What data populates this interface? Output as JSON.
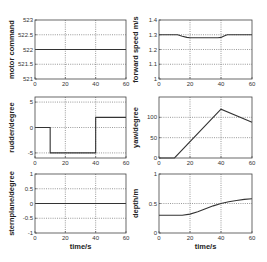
{
  "figure": {
    "x_axis_label": "time/s",
    "line_color": "#333333",
    "grid_color": "#555555",
    "frame_color": "#444444"
  },
  "chart_data": [
    {
      "id": "motor",
      "type": "line",
      "title": "",
      "xlabel": "",
      "ylabel": "motor command",
      "xlim": [
        0,
        60
      ],
      "ylim": [
        521,
        523
      ],
      "xticks": [
        0,
        20,
        40,
        60
      ],
      "yticks": [
        521,
        521.5,
        522,
        522.5,
        523
      ],
      "ytick_labels": [
        "521",
        "521.5",
        "522",
        "522.5",
        "523"
      ],
      "grid": true,
      "series": [
        {
          "name": "motor command",
          "x": [
            0,
            60
          ],
          "y": [
            522,
            522
          ]
        }
      ]
    },
    {
      "id": "speed",
      "type": "line",
      "title": "",
      "xlabel": "",
      "ylabel": "forward speed m/s",
      "xlim": [
        0,
        60
      ],
      "ylim": [
        1.0,
        1.4
      ],
      "xticks": [
        0,
        20,
        40,
        60
      ],
      "yticks": [
        1.0,
        1.1,
        1.2,
        1.3,
        1.4
      ],
      "ytick_labels": [
        "1",
        "1.1",
        "1.2",
        "1.3",
        "1.4"
      ],
      "grid": true,
      "series": [
        {
          "name": "forward speed",
          "x": [
            0,
            12,
            15,
            18,
            20,
            38,
            40,
            42,
            44,
            60
          ],
          "y": [
            1.3,
            1.3,
            1.29,
            1.282,
            1.28,
            1.28,
            1.282,
            1.292,
            1.3,
            1.3
          ]
        }
      ]
    },
    {
      "id": "rudder",
      "type": "line",
      "title": "",
      "xlabel": "",
      "ylabel": "rudder/degree",
      "xlim": [
        0,
        60
      ],
      "ylim": [
        -6,
        6
      ],
      "xticks": [
        0,
        20,
        40,
        60
      ],
      "yticks": [
        -5,
        0,
        5
      ],
      "ytick_labels": [
        "-5",
        "0",
        "5"
      ],
      "grid": true,
      "series": [
        {
          "name": "rudder",
          "x": [
            0,
            10,
            10,
            40,
            40,
            60
          ],
          "y": [
            0,
            0,
            -5,
            -5,
            2,
            2
          ]
        }
      ]
    },
    {
      "id": "yaw",
      "type": "line",
      "title": "",
      "xlabel": "",
      "ylabel": "yaw/degree",
      "xlim": [
        0,
        60
      ],
      "ylim": [
        0,
        150
      ],
      "xticks": [
        0,
        20,
        40,
        60
      ],
      "yticks": [
        0,
        50,
        100
      ],
      "ytick_labels": [
        "0",
        "50",
        "100"
      ],
      "grid": true,
      "series": [
        {
          "name": "yaw",
          "x": [
            0,
            10,
            40,
            60
          ],
          "y": [
            0,
            0,
            120,
            88
          ]
        }
      ]
    },
    {
      "id": "stern",
      "type": "line",
      "title": "",
      "xlabel": "time/s",
      "ylabel": "sternplane/degree",
      "xlim": [
        0,
        60
      ],
      "ylim": [
        -1,
        1
      ],
      "xticks": [
        0,
        20,
        40,
        60
      ],
      "yticks": [
        -1,
        -0.5,
        0,
        0.5,
        1
      ],
      "ytick_labels": [
        "-1",
        "-0.5",
        "0",
        "0.5",
        "1"
      ],
      "grid": true,
      "series": [
        {
          "name": "sternplane",
          "x": [
            0,
            60
          ],
          "y": [
            0,
            0
          ]
        }
      ]
    },
    {
      "id": "depth",
      "type": "line",
      "title": "",
      "xlabel": "time/s",
      "ylabel": "depth/m",
      "xlim": [
        0,
        60
      ],
      "ylim": [
        0,
        1
      ],
      "xticks": [
        0,
        20,
        40,
        60
      ],
      "yticks": [
        0,
        0.5,
        1
      ],
      "ytick_labels": [
        "0",
        "0.5",
        "1"
      ],
      "grid": true,
      "series": [
        {
          "name": "depth",
          "x": [
            0,
            10,
            15,
            20,
            25,
            30,
            35,
            40,
            45,
            50,
            55,
            60
          ],
          "y": [
            0.3,
            0.3,
            0.3,
            0.32,
            0.36,
            0.41,
            0.46,
            0.5,
            0.53,
            0.55,
            0.57,
            0.58
          ]
        }
      ]
    }
  ]
}
